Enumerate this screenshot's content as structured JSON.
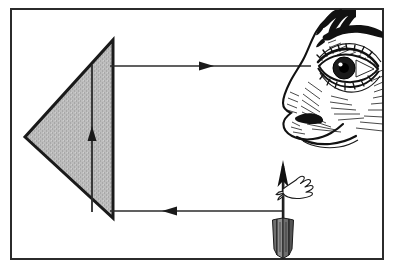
{
  "figure": {
    "background_color": "#ffffff",
    "border": {
      "name": "figure-border",
      "color": "#2b2b2b",
      "x": 11,
      "y": 9,
      "width": 372,
      "height": 250,
      "stroke_width": 2
    },
    "prism": {
      "label": "triangular prism",
      "fill_color": "#b7b7b7",
      "stroke_color": "#1a1a1a",
      "stroke_width": 3,
      "points": "113,40 113,218 25,137",
      "orientation": "left-pointing",
      "apex_x": 25,
      "apex_y": 137,
      "top_x": 113,
      "top_y": 40,
      "bottom_x": 113,
      "bottom_y": 218
    },
    "rays": [
      {
        "name": "upper-ray",
        "label": "ray to eye",
        "direction": "right",
        "x1": 113,
        "y1": 66,
        "x2": 311,
        "y2": 66,
        "color": "#2b2b2b",
        "arrowhead_x": 210
      },
      {
        "name": "lower-ray",
        "label": "ray from object",
        "direction": "left",
        "x1": 283,
        "y1": 211,
        "x2": 113,
        "y2": 211,
        "color": "#2b2b2b",
        "arrowhead_x": 163
      },
      {
        "name": "internal-vertical-ray",
        "label": "ray inside prism",
        "direction": "up",
        "x1": 92,
        "y1": 211,
        "x2": 92,
        "y2": 66,
        "color": "#2b2b2b",
        "arrowhead_y": 128
      }
    ],
    "object_arrow": {
      "name": "object-arrow",
      "label": "arrow object with fletching",
      "shaft_x": 283,
      "tip_y": 161,
      "tail_y": 258,
      "color": "#1a1a1a",
      "fletching_top": 218,
      "fletching_bottom": 253,
      "feather": {
        "label": "feather vane",
        "x": 288,
        "y": 178
      }
    },
    "face": {
      "name": "observer-face",
      "label": "human face in profile with eye and nose",
      "ink_color": "#111111",
      "parts": [
        "forelock",
        "eyebrow",
        "upper-eyelid",
        "iris",
        "pupil",
        "eyelashes",
        "lower-eyelid",
        "nose-bridge",
        "nose-tip",
        "nostril",
        "upper-lip"
      ]
    }
  }
}
